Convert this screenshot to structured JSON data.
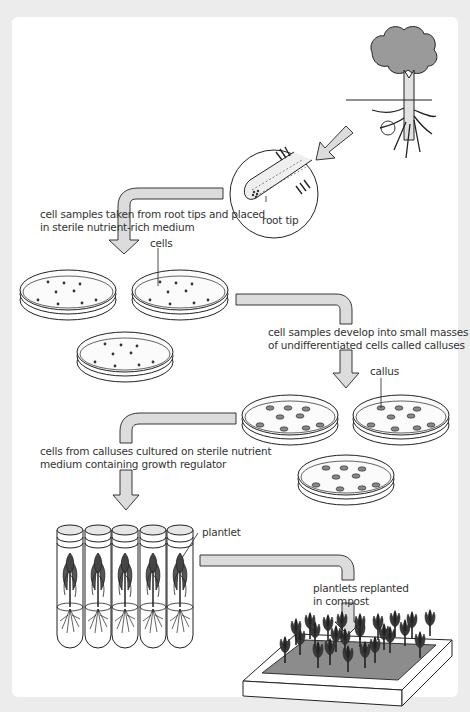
{
  "diagram": {
    "topic": "plant tissue culture (micropropagation)",
    "steps": [
      {
        "id": "step1",
        "text_lines": [
          "cell samples taken from root tips and placed",
          "in sterile nutrient-rich medium"
        ]
      },
      {
        "id": "step2",
        "text_lines": [
          "cell samples develop into small masses",
          "of undifferentiated cells called calluses"
        ]
      },
      {
        "id": "step3",
        "text_lines": [
          "cells from calluses cultured on sterile nutrient",
          "medium containing growth regulator"
        ]
      },
      {
        "id": "step4",
        "text_lines": [
          "plantlets replanted",
          "in compost"
        ]
      }
    ],
    "labels": {
      "root_tip": "root tip",
      "cells": "cells",
      "callus": "callus",
      "plantlet": "plantlet"
    },
    "counts": {
      "petri_dishes_cells": 3,
      "petri_dishes_callus": 3,
      "test_tubes": 5,
      "compost_plants": 24
    },
    "colors": {
      "page_background": "#ececec",
      "panel_background": "#ffffff",
      "arrow_fill": "#dcdcdc",
      "outline": "#222222",
      "tree_canopy": "#9a9a9a",
      "plant_dark": "#3a3a3a",
      "compost": "#8c8c8c",
      "text": "#333333"
    }
  }
}
